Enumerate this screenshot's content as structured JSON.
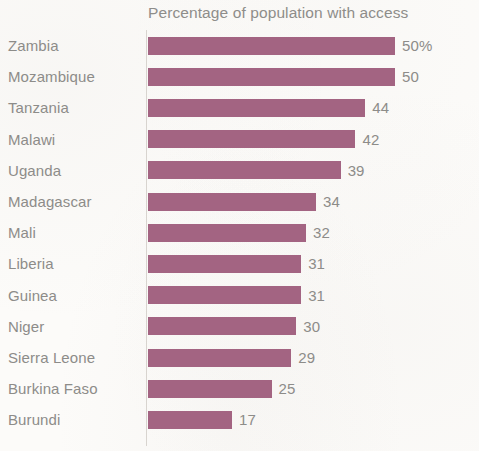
{
  "chart_data": {
    "type": "bar",
    "orientation": "horizontal",
    "title": "Percentage of population with access",
    "xlabel": "",
    "ylabel": "",
    "xlim": [
      0,
      50
    ],
    "grid": false,
    "legend": null,
    "bar_color": "#9c5878",
    "text_color": "#8d8c89",
    "background_color": "#fcfbf9",
    "categories": [
      "Zambia",
      "Mozambique",
      "Tanzania",
      "Malawi",
      "Uganda",
      "Madagascar",
      "Mali",
      "Liberia",
      "Guinea",
      "Niger",
      "Sierra Leone",
      "Burkina Faso",
      "Burundi"
    ],
    "values": [
      50,
      50,
      44,
      42,
      39,
      34,
      32,
      31,
      31,
      30,
      29,
      25,
      17
    ],
    "value_labels": [
      "50%",
      "50",
      "44",
      "42",
      "39",
      "34",
      "32",
      "31",
      "31",
      "30",
      "29",
      "25",
      "17"
    ]
  }
}
